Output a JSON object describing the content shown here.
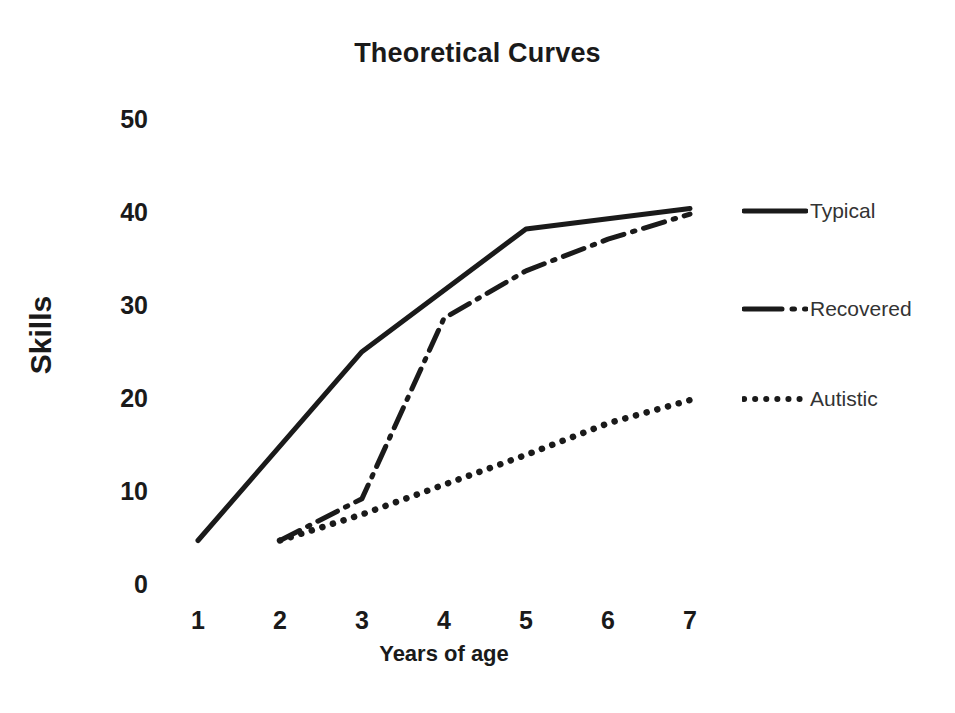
{
  "chart_data": {
    "type": "line",
    "title": "Theoretical Curves",
    "xlabel": "Years of age",
    "ylabel": "Skills",
    "x": [
      1,
      2,
      3,
      4,
      5,
      6,
      7
    ],
    "xtick_labels": [
      "1",
      "2",
      "3",
      "4",
      "5",
      "6",
      "7"
    ],
    "ytick_labels": [
      "0",
      "10",
      "20",
      "30",
      "40",
      "50"
    ],
    "ytick_values": [
      0,
      10,
      20,
      30,
      40,
      50
    ],
    "xlim": [
      1,
      7
    ],
    "ylim": [
      0,
      50
    ],
    "grid": false,
    "legend_position": "right",
    "series": [
      {
        "name": "Typical",
        "style": "solid",
        "color": "#1a1a1a",
        "x": [
          1,
          3,
          5,
          7
        ],
        "values": [
          5.0,
          25.3,
          38.5,
          40.7
        ]
      },
      {
        "name": "Recovered",
        "style": "dash-dot",
        "color": "#1a1a1a",
        "x": [
          2,
          3,
          4,
          5,
          6,
          7
        ],
        "values": [
          5.0,
          9.5,
          28.9,
          34.0,
          37.4,
          40.1
        ]
      },
      {
        "name": "Autistic",
        "style": "dotted",
        "color": "#1a1a1a",
        "x": [
          2,
          3,
          4,
          5,
          6,
          7
        ],
        "values": [
          5.0,
          7.8,
          11.0,
          14.2,
          17.6,
          20.1
        ]
      }
    ]
  },
  "legend": {
    "items": [
      {
        "label": "Typical",
        "swatch": "solid-line-swatch"
      },
      {
        "label": "Recovered",
        "swatch": "dash-dot-line-swatch"
      },
      {
        "label": "Autistic",
        "swatch": "dotted-line-swatch"
      }
    ]
  }
}
